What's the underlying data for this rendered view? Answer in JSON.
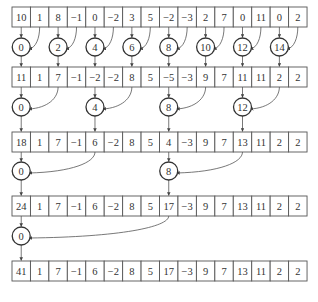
{
  "diagram": {
    "title": "",
    "rows": [
      {
        "values": [
          "10",
          "1",
          "8",
          "−1",
          "0",
          "−2",
          "3",
          "5",
          "−2",
          "−3",
          "2",
          "7",
          "0",
          "11",
          "0",
          "2"
        ]
      },
      {
        "values": [
          "11",
          "1",
          "7",
          "−1",
          "−2",
          "−2",
          "8",
          "5",
          "−5",
          "−3",
          "9",
          "7",
          "11",
          "11",
          "2",
          "2"
        ]
      },
      {
        "values": [
          "18",
          "1",
          "7",
          "−1",
          "6",
          "−2",
          "8",
          "5",
          "4",
          "−3",
          "9",
          "7",
          "13",
          "11",
          "2",
          "2"
        ]
      },
      {
        "values": [
          "24",
          "1",
          "7",
          "−1",
          "6",
          "−2",
          "8",
          "5",
          "17",
          "−3",
          "9",
          "7",
          "13",
          "11",
          "2",
          "2"
        ]
      },
      {
        "values": [
          "41",
          "1",
          "7",
          "−1",
          "6",
          "−2",
          "8",
          "5",
          "17",
          "−3",
          "9",
          "7",
          "13",
          "11",
          "2",
          "2"
        ]
      }
    ],
    "levels": [
      {
        "stride": 1,
        "nodes": [
          {
            "label": "0",
            "target": 0,
            "source": 1
          },
          {
            "label": "2",
            "target": 2,
            "source": 3
          },
          {
            "label": "4",
            "target": 4,
            "source": 5
          },
          {
            "label": "6",
            "target": 6,
            "source": 7
          },
          {
            "label": "8",
            "target": 8,
            "source": 9
          },
          {
            "label": "10",
            "target": 10,
            "source": 11
          },
          {
            "label": "12",
            "target": 12,
            "source": 13
          },
          {
            "label": "14",
            "target": 14,
            "source": 15
          }
        ]
      },
      {
        "stride": 2,
        "nodes": [
          {
            "label": "0",
            "target": 0,
            "source": 2
          },
          {
            "label": "4",
            "target": 4,
            "source": 6
          },
          {
            "label": "8",
            "target": 8,
            "source": 10
          },
          {
            "label": "12",
            "target": 12,
            "source": 14
          }
        ]
      },
      {
        "stride": 4,
        "nodes": [
          {
            "label": "0",
            "target": 0,
            "source": 4
          },
          {
            "label": "8",
            "target": 8,
            "source": 12
          }
        ]
      },
      {
        "stride": 8,
        "nodes": [
          {
            "label": "0",
            "target": 0,
            "source": 8
          }
        ]
      }
    ]
  },
  "colors": {
    "line": "#555555",
    "text": "#333333",
    "background": "#ffffff"
  }
}
